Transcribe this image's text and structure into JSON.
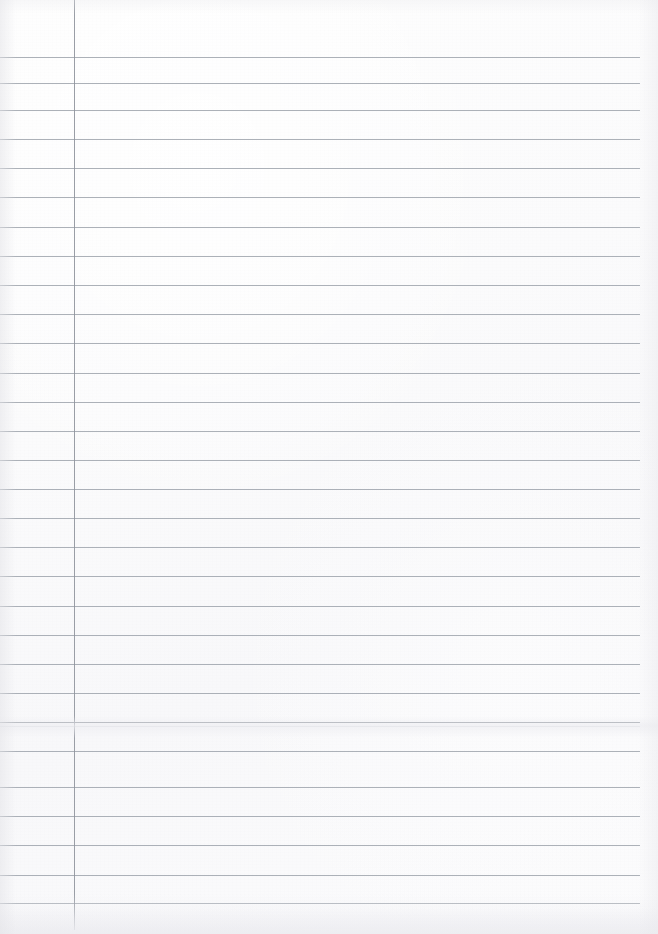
{
  "document": {
    "kind": "lined-notebook-paper",
    "title": "Blank ruled notebook page",
    "page_width": 658,
    "page_height": 934,
    "content_text": "",
    "handwriting": "",
    "visible_text": ""
  },
  "colors": {
    "paper": "#fdfdfd",
    "rule_line": "#9ea3ab",
    "rule_line_strong": "#8b9099",
    "margin_rule": "#8f949c",
    "edge_shadow": "#e8e8ec"
  },
  "ruling": {
    "first_line_y": 57,
    "line_spacing": 29.2,
    "line_count": 30,
    "line_left_x": 0,
    "line_right_x": 640,
    "line_thickness": 1,
    "lines": [
      {
        "y": 57,
        "weight": "normal"
      },
      {
        "y": 83,
        "weight": "normal"
      },
      {
        "y": 110,
        "weight": "normal"
      },
      {
        "y": 139,
        "weight": "normal"
      },
      {
        "y": 168,
        "weight": "normal"
      },
      {
        "y": 197,
        "weight": "normal"
      },
      {
        "y": 227,
        "weight": "normal"
      },
      {
        "y": 256,
        "weight": "normal"
      },
      {
        "y": 285,
        "weight": "normal"
      },
      {
        "y": 314,
        "weight": "normal"
      },
      {
        "y": 343,
        "weight": "normal"
      },
      {
        "y": 373,
        "weight": "normal"
      },
      {
        "y": 402,
        "weight": "normal"
      },
      {
        "y": 431,
        "weight": "normal"
      },
      {
        "y": 460,
        "weight": "normal"
      },
      {
        "y": 489,
        "weight": "normal"
      },
      {
        "y": 518,
        "weight": "normal"
      },
      {
        "y": 547,
        "weight": "normal"
      },
      {
        "y": 576,
        "weight": "normal"
      },
      {
        "y": 606,
        "weight": "normal"
      },
      {
        "y": 635,
        "weight": "normal"
      },
      {
        "y": 664,
        "weight": "normal"
      },
      {
        "y": 693,
        "weight": "normal"
      },
      {
        "y": 722,
        "weight": "double"
      },
      {
        "y": 751,
        "weight": "normal"
      },
      {
        "y": 787,
        "weight": "normal"
      },
      {
        "y": 816,
        "weight": "normal"
      },
      {
        "y": 845,
        "weight": "normal"
      },
      {
        "y": 875,
        "weight": "normal"
      },
      {
        "y": 903,
        "weight": "normal"
      }
    ]
  },
  "margin": {
    "x": 74,
    "top_y": 0,
    "bottom_y": 930,
    "label": "left-margin-rule"
  },
  "crease": {
    "y": 716,
    "height": 22
  }
}
